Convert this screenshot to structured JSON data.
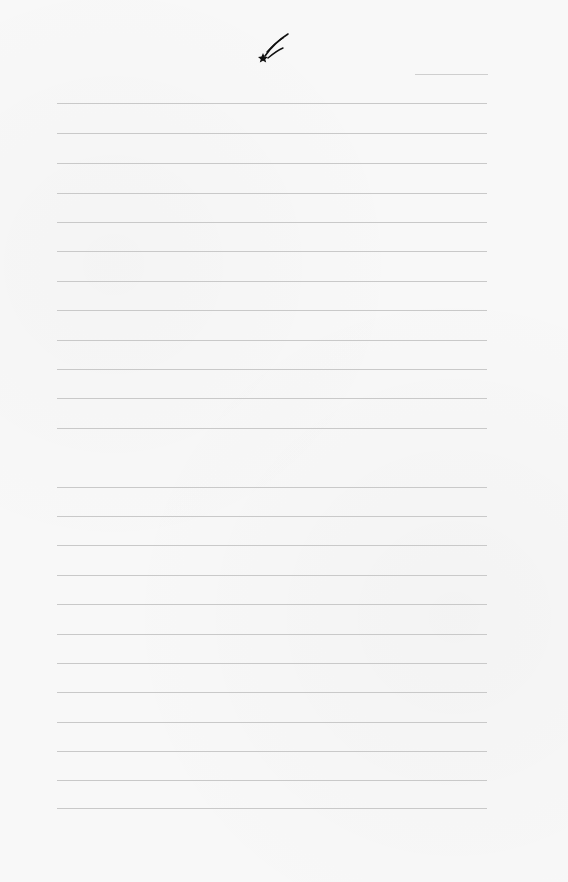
{
  "page": {
    "type": "lined-stationery",
    "background_color": "#f8f8f8",
    "rule_color": "#c9c9c9",
    "logo": {
      "icon": "shooting-star-icon",
      "color": "#111111"
    },
    "date_line": {
      "y": 74,
      "x": 415,
      "width": 73
    },
    "rules": {
      "x": 57,
      "width": 430,
      "y_positions": [
        103,
        133,
        163,
        193,
        222,
        251,
        281,
        310,
        340,
        369,
        398,
        428,
        487,
        516,
        545,
        575,
        604,
        634,
        663,
        692,
        722,
        751,
        780,
        808
      ]
    }
  }
}
